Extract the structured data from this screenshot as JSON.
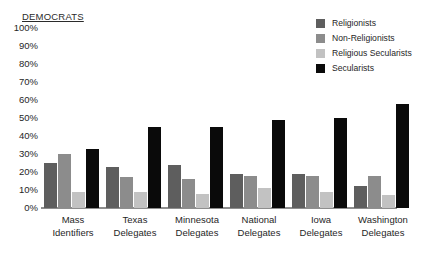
{
  "chart_data": {
    "type": "bar",
    "title": "DEMOCRATS",
    "xlabel": "",
    "ylabel": "",
    "ylim": [
      0,
      100
    ],
    "ytick_labels": [
      "100%",
      "90%",
      "80%",
      "70%",
      "60%",
      "50%",
      "40%",
      "30%",
      "20%",
      "10%",
      "0%"
    ],
    "ytick_values": [
      100,
      90,
      80,
      70,
      60,
      50,
      40,
      30,
      20,
      10,
      0
    ],
    "grid": false,
    "legend_position": "top-right",
    "categories": [
      "Mass Identifiers",
      "Texas Delegates",
      "Minnesota Delegates",
      "National Delegates",
      "Iowa Delegates",
      "Washington Delegates"
    ],
    "category_lines": [
      [
        "Mass",
        "Identifiers"
      ],
      [
        "Texas",
        "Delegates"
      ],
      [
        "Minnesota",
        "Delegates"
      ],
      [
        "National",
        "Delegates"
      ],
      [
        "Iowa",
        "Delegates"
      ],
      [
        "Washington",
        "Delegates"
      ]
    ],
    "series": [
      {
        "name": "Religionists",
        "color": "#5e5e5e",
        "values": [
          25,
          23,
          24,
          19,
          19,
          12
        ]
      },
      {
        "name": "Non-Religionists",
        "color": "#8c8c8c",
        "values": [
          30,
          17,
          16,
          18,
          18,
          18
        ]
      },
      {
        "name": "Religious Secularists",
        "color": "#c2c2c2",
        "values": [
          9,
          9,
          8,
          11,
          9,
          7
        ]
      },
      {
        "name": "Secularists",
        "color": "#0a0a0a",
        "values": [
          33,
          45,
          45,
          49,
          50,
          58
        ]
      }
    ]
  },
  "legend": {
    "items": [
      {
        "label": "Religionists",
        "color": "#5e5e5e"
      },
      {
        "label": "Non-Religionists",
        "color": "#8c8c8c"
      },
      {
        "label": "Religious Secularists",
        "color": "#c2c2c2"
      },
      {
        "label": "Secularists",
        "color": "#0a0a0a"
      }
    ]
  }
}
